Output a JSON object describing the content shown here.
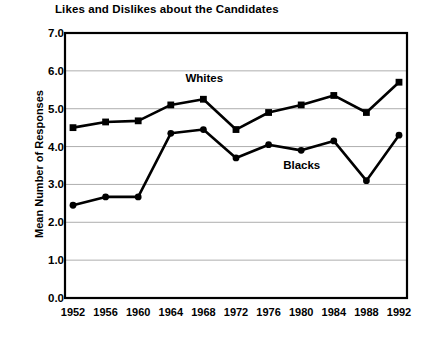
{
  "chart_data": {
    "type": "line",
    "title": "Likes and Dislikes about the Candidates",
    "xlabel": "",
    "ylabel": "Mean Number of Responses",
    "ylim": [
      0.0,
      7.0
    ],
    "ytick_labels": [
      "0.0",
      "1.0",
      "2.0",
      "3.0",
      "4.0",
      "5.0",
      "6.0",
      "7.0"
    ],
    "ytick_values": [
      0.0,
      1.0,
      2.0,
      3.0,
      4.0,
      5.0,
      6.0,
      7.0
    ],
    "grid": "horizontal",
    "legend_position": "inline-annotation",
    "categories": [
      "1952",
      "1956",
      "1960",
      "1964",
      "1968",
      "1972",
      "1976",
      "1980",
      "1984",
      "1988",
      "1992"
    ],
    "x": [
      1952,
      1956,
      1960,
      1964,
      1968,
      1972,
      1976,
      1980,
      1984,
      1988,
      1992
    ],
    "series": [
      {
        "name": "Whites",
        "marker": "square",
        "values": [
          4.5,
          4.65,
          4.68,
          5.1,
          5.25,
          4.45,
          4.9,
          5.1,
          5.35,
          4.9,
          5.7
        ]
      },
      {
        "name": "Blacks",
        "marker": "circle",
        "values": [
          2.45,
          2.67,
          2.67,
          4.35,
          4.45,
          3.7,
          4.05,
          3.9,
          4.15,
          3.1,
          4.3
        ]
      }
    ],
    "annotations": [
      {
        "text": "Whites",
        "x": 1968,
        "y": 5.75
      },
      {
        "text": "Blacks",
        "x": 1980,
        "y": 3.45
      }
    ]
  },
  "colors": {
    "line": "#000000",
    "grid": "#999999",
    "axis": "#000000",
    "background": "#ffffff"
  }
}
